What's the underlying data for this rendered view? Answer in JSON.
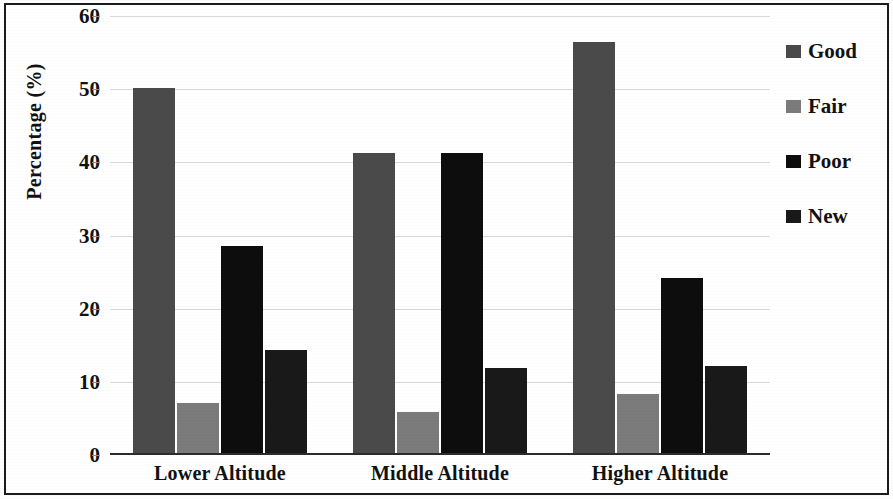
{
  "chart_data": {
    "type": "bar",
    "title": "",
    "xlabel": "",
    "ylabel": "Percentage (%)",
    "ylim": [
      0,
      60
    ],
    "ytick_step": 10,
    "yticks": [
      "0",
      "10",
      "20",
      "30",
      "40",
      "50",
      "60"
    ],
    "grid": true,
    "legend_position": "right",
    "categories": [
      "Lower Altitude",
      "Middle Altitude",
      "Higher Altitude"
    ],
    "series": [
      {
        "name": "Good",
        "color": "#4a4a4a",
        "values": [
          50.2,
          41.3,
          56.4
        ]
      },
      {
        "name": "Fair",
        "color": "#7b7b7b",
        "values": [
          7.1,
          5.9,
          8.3
        ]
      },
      {
        "name": "Poor",
        "color": "#0d0d0d",
        "values": [
          28.6,
          41.3,
          24.2
        ]
      },
      {
        "name": "New",
        "color": "#191919",
        "values": [
          14.3,
          11.9,
          12.2
        ]
      }
    ]
  },
  "legend": {
    "items": [
      {
        "label": "Good"
      },
      {
        "label": "Fair"
      },
      {
        "label": "Poor"
      },
      {
        "label": "New"
      }
    ]
  }
}
